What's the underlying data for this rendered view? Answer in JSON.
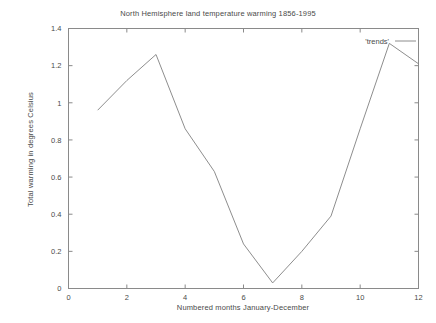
{
  "chart_data": {
    "type": "line",
    "title": "North Hemisphere land temperature warming 1856-1995",
    "xlabel": "Numbered months January-December",
    "ylabel": "Total warming in degrees Celsius",
    "x": [
      1,
      2,
      3,
      4,
      5,
      6,
      7,
      8,
      9,
      10,
      11,
      12
    ],
    "series": [
      {
        "name": "'trends'",
        "values": [
          0.96,
          1.12,
          1.26,
          0.86,
          0.63,
          0.24,
          0.03,
          0.2,
          0.39,
          0.86,
          1.32,
          1.21
        ]
      }
    ],
    "xlim": [
      0,
      12
    ],
    "ylim": [
      0,
      1.4
    ],
    "xticks": [
      "0",
      "2",
      "4",
      "6",
      "8",
      "10",
      "12"
    ],
    "xtick_values": [
      0,
      2,
      4,
      6,
      8,
      10,
      12
    ],
    "yticks": [
      "0",
      "0.2",
      "0.4",
      "0.6",
      "0.8",
      "1",
      "1.2",
      "1.4"
    ],
    "ytick_values": [
      0,
      0.2,
      0.4,
      0.6,
      0.8,
      1,
      1.2,
      1.4
    ],
    "grid": false,
    "legend_position": "top-right",
    "line_color": "#808080",
    "axis_color": "#8a8a8a",
    "text_color": "#4a4a4a",
    "background": "#ffffff"
  },
  "legend": {
    "entries": [
      {
        "label": "'trends'"
      }
    ]
  }
}
